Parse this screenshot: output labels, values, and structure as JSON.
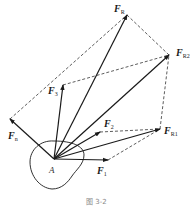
{
  "diagram": {
    "origin": {
      "label": "A",
      "x": 54,
      "y": 159
    },
    "forces": [
      {
        "name": "F1",
        "base": "F",
        "sub": "1",
        "tip": [
          108,
          160
        ],
        "label_pos": [
          97,
          174
        ]
      },
      {
        "name": "F2",
        "base": "F",
        "sub": "2",
        "tip": [
          100,
          132
        ],
        "label_pos": [
          104,
          127
        ]
      },
      {
        "name": "F3",
        "base": "F",
        "sub": "3",
        "tip": [
          63,
          85
        ],
        "label_pos": [
          48,
          94
        ]
      },
      {
        "name": "Fn",
        "base": "F",
        "sub": "n",
        "tip": [
          10,
          119
        ],
        "label_pos": [
          8,
          139
        ]
      },
      {
        "name": "FR1",
        "base": "F",
        "sub": "R1",
        "tip": [
          160,
          129
        ],
        "label_pos": [
          164,
          134
        ]
      },
      {
        "name": "FR2",
        "base": "F",
        "sub": "R2",
        "tip": [
          169,
          55
        ],
        "label_pos": [
          176,
          56
        ]
      },
      {
        "name": "FR",
        "base": "F",
        "sub": "R",
        "tip": [
          127,
          15
        ],
        "label_pos": [
          114,
          12
        ]
      }
    ],
    "dashed_lines": [
      [
        [
          108,
          160
        ],
        [
          160,
          129
        ]
      ],
      [
        [
          100,
          132
        ],
        [
          160,
          129
        ]
      ],
      [
        [
          160,
          129
        ],
        [
          169,
          55
        ]
      ],
      [
        [
          63,
          85
        ],
        [
          169,
          55
        ]
      ],
      [
        [
          169,
          55
        ],
        [
          127,
          15
        ]
      ],
      [
        [
          10,
          119
        ],
        [
          127,
          15
        ]
      ]
    ],
    "caption": "图 3-2"
  }
}
